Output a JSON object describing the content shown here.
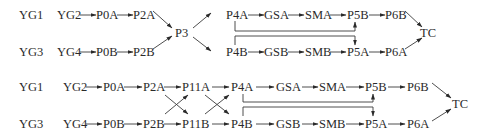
{
  "diagrams": [
    {
      "id": "diagram-1",
      "rows": [
        {
          "label": "YG1",
          "nodes": [
            "YG2",
            "P0A",
            "P2A"
          ]
        },
        {
          "label": "YG3",
          "nodes": [
            "YG4",
            "P0B",
            "P2B"
          ]
        }
      ],
      "merge_node": "P3",
      "after_merge_rows": [
        {
          "nodes": [
            "P4A",
            "GSA",
            "SMA",
            "P5B",
            "P6B"
          ]
        },
        {
          "nodes": [
            "P4B",
            "GSB",
            "SMB",
            "P5A",
            "P6A"
          ]
        }
      ],
      "cross_links": [
        {
          "from": "P4A",
          "to": "P5A"
        },
        {
          "from": "P4B",
          "to": "P5B"
        }
      ],
      "terminal": "TC"
    },
    {
      "id": "diagram-2",
      "rows": [
        {
          "label": "YG1",
          "nodes": [
            "YG2",
            "P0A",
            "P2A",
            "P11A",
            "P4A",
            "GSA",
            "SMA",
            "P5B",
            "P6B"
          ]
        },
        {
          "label": "YG3",
          "nodes": [
            "YG4",
            "P0B",
            "P2B",
            "P11B",
            "P4B",
            "GSB",
            "SMB",
            "P5A",
            "P6A"
          ]
        }
      ],
      "cross_links": [
        {
          "from": "P2A",
          "to": "P11B"
        },
        {
          "from": "P2B",
          "to": "P11A"
        },
        {
          "from": "P11A",
          "to": "P4B"
        },
        {
          "from": "P11B",
          "to": "P4A"
        },
        {
          "from": "P4A",
          "to": "P5A"
        },
        {
          "from": "P4B",
          "to": "P5B"
        }
      ],
      "terminal": "TC"
    }
  ]
}
